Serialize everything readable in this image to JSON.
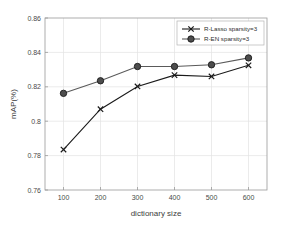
{
  "chart_data": {
    "type": "line",
    "title": "",
    "xlabel": "dictionary size",
    "ylabel": "mAP(%)",
    "x": [
      100,
      200,
      300,
      400,
      500,
      600
    ],
    "xticklabels": [
      "100",
      "200",
      "300",
      "400",
      "500",
      "600"
    ],
    "yticklabels": [
      "0.76",
      "0.78",
      "0.8",
      "0.82",
      "0.84",
      "0.86"
    ],
    "yticks": [
      0.76,
      0.78,
      0.8,
      0.82,
      0.84,
      0.86
    ],
    "xlim": [
      50,
      650
    ],
    "ylim": [
      0.76,
      0.86
    ],
    "grid": true,
    "legend_position": "top-right",
    "series": [
      {
        "name": "R-Lasso sparsity=3",
        "marker": "x-marker",
        "color": "#1a1a1a",
        "values": [
          0.7835,
          0.807,
          0.8202,
          0.8268,
          0.826,
          0.8325
        ]
      },
      {
        "name": "R-EN sparsity=3",
        "marker": "filled-circle-marker",
        "color": "#5a5a5a",
        "values": [
          0.8162,
          0.8235,
          0.8318,
          0.8318,
          0.8328,
          0.8368
        ]
      }
    ]
  },
  "colors": {
    "background": "#ffffff",
    "grid": "#e2e2e2",
    "axis": "#9a9a9a",
    "series_lasso": "#1a1a1a",
    "series_en": "#5a5a5a",
    "marker_fill": "#4d4d4d",
    "text": "#3c3c3c"
  },
  "legend": {
    "entries": [
      {
        "label": "R-Lasso sparsity=3"
      },
      {
        "label": "R-EN sparsity=3"
      }
    ]
  }
}
